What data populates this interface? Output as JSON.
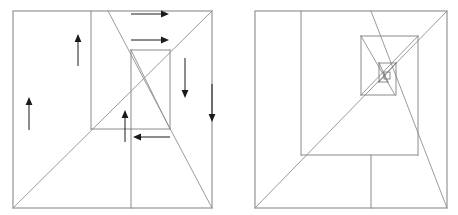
{
  "figure": {
    "background_color": "#ffffff",
    "line_color": "#8a8a8a",
    "arrow_color": "#1a1a1a",
    "width": 458,
    "height": 215,
    "panel_count": 2
  },
  "panels": [
    {
      "id": "left-panel",
      "name": "arrowed-construction-panel",
      "has_arrows": true,
      "outer_square": {
        "x1": 13,
        "y1": 11,
        "x2": 212,
        "y2": 208
      },
      "segments": [
        {
          "name": "vertical-left-partition",
          "x1": 91,
          "y1": 11,
          "x2": 91,
          "y2": 129
        },
        {
          "name": "vertical-lower-center",
          "x1": 131,
          "y1": 129,
          "x2": 131,
          "y2": 208
        },
        {
          "name": "horizontal-mid-band",
          "x1": 91,
          "y1": 129,
          "x2": 170,
          "y2": 129
        },
        {
          "name": "inner-rect-top",
          "x1": 131,
          "y1": 50,
          "x2": 170,
          "y2": 50
        },
        {
          "name": "inner-rect-left",
          "x1": 131,
          "y1": 50,
          "x2": 131,
          "y2": 129
        },
        {
          "name": "inner-rect-right",
          "x1": 170,
          "y1": 50,
          "x2": 170,
          "y2": 129
        },
        {
          "name": "diagonal-main-rising",
          "x1": 13,
          "y1": 208,
          "x2": 212,
          "y2": 11
        },
        {
          "name": "diagonal-falling-upper",
          "x1": 108,
          "y1": 11,
          "x2": 212,
          "y2": 208
        },
        {
          "name": "diagonal-inner-falling",
          "x1": 131,
          "y1": 50,
          "x2": 170,
          "y2": 129
        }
      ],
      "arrows": [
        {
          "name": "arrow-up-outer-left",
          "direction": "up",
          "x": 29,
          "y1": 130,
          "y2": 97
        },
        {
          "name": "arrow-up-partition",
          "direction": "up",
          "x": 78,
          "y1": 66,
          "y2": 34
        },
        {
          "name": "arrow-right-top",
          "direction": "right",
          "y": 14,
          "x1": 131,
          "x2": 170
        },
        {
          "name": "arrow-right-inner-top",
          "direction": "right",
          "y": 40,
          "x1": 131,
          "x2": 170
        },
        {
          "name": "arrow-down-inner-right",
          "direction": "down",
          "x": 185,
          "y1": 58,
          "y2": 93
        },
        {
          "name": "arrow-down-outer-right",
          "direction": "down",
          "x": 212,
          "y1": 84,
          "y2": 117
        },
        {
          "name": "arrow-up-inner-center",
          "direction": "up",
          "x": 125,
          "y1": 142,
          "y2": 110
        },
        {
          "name": "arrow-left-lower",
          "direction": "left",
          "y": 137,
          "x1": 170,
          "x2": 131
        }
      ]
    },
    {
      "id": "right-panel",
      "name": "recursive-nesting-panel",
      "has_arrows": false,
      "outer_square": {
        "x1": 255,
        "y1": 11,
        "x2": 447,
        "y2": 208
      },
      "segments": [
        {
          "name": "vertical-left-partition",
          "x1": 301,
          "y1": 11,
          "x2": 301,
          "y2": 155
        },
        {
          "name": "horizontal-lower-band",
          "x1": 301,
          "y1": 155,
          "x2": 418,
          "y2": 155
        },
        {
          "name": "vertical-lower-center",
          "x1": 371,
          "y1": 155,
          "x2": 371,
          "y2": 208
        },
        {
          "name": "level2-rect-top",
          "x1": 361,
          "y1": 36,
          "x2": 418,
          "y2": 36
        },
        {
          "name": "level2-rect-left",
          "x1": 361,
          "y1": 36,
          "x2": 361,
          "y2": 95
        },
        {
          "name": "level2-rect-right",
          "x1": 418,
          "y1": 36,
          "x2": 418,
          "y2": 155
        },
        {
          "name": "level2-rect-bottom",
          "x1": 361,
          "y1": 95,
          "x2": 395,
          "y2": 95
        },
        {
          "name": "level3-rect-top",
          "x1": 379,
          "y1": 63,
          "x2": 396,
          "y2": 63
        },
        {
          "name": "level3-rect-left",
          "x1": 379,
          "y1": 63,
          "x2": 379,
          "y2": 82
        },
        {
          "name": "level3-rect-right",
          "x1": 396,
          "y1": 63,
          "x2": 396,
          "y2": 95
        },
        {
          "name": "level3-rect-bottom",
          "x1": 379,
          "y1": 82,
          "x2": 388,
          "y2": 82
        },
        {
          "name": "level4-rect",
          "x1": 384,
          "y1": 72,
          "x2": 390,
          "y2": 79
        },
        {
          "name": "diagonal-main-rising",
          "x1": 255,
          "y1": 208,
          "x2": 447,
          "y2": 11
        },
        {
          "name": "diagonal-falling-outer",
          "x1": 371,
          "y1": 11,
          "x2": 447,
          "y2": 208
        },
        {
          "name": "diagonal-level2-falling",
          "x1": 361,
          "y1": 36,
          "x2": 395,
          "y2": 95
        },
        {
          "name": "diagonal-level2-rising",
          "x1": 361,
          "y1": 95,
          "x2": 418,
          "y2": 36
        },
        {
          "name": "diagonal-level3-falling",
          "x1": 379,
          "y1": 63,
          "x2": 388,
          "y2": 82
        },
        {
          "name": "diagonal-level3-rising",
          "x1": 379,
          "y1": 82,
          "x2": 396,
          "y2": 63
        }
      ],
      "arrows": []
    }
  ]
}
